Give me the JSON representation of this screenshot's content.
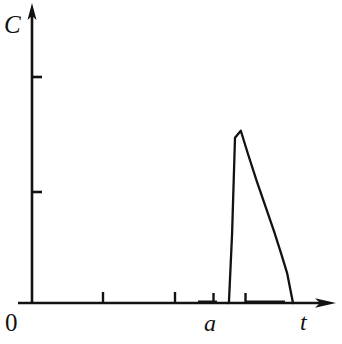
{
  "figure": {
    "title": "",
    "background_color": "#ffffff",
    "ink_color": "#121212",
    "width": 342,
    "height": 344
  },
  "labels": {
    "y_axis": "C",
    "x_axis": "t",
    "origin": "0",
    "peak_position": "a"
  },
  "chart_data": {
    "type": "line",
    "title": "",
    "xlabel": "t",
    "ylabel": "C",
    "origin_label": "0",
    "grid": false,
    "legend": null,
    "annotations": [
      {
        "text": "a",
        "x": 0.62,
        "y": 0,
        "role": "x-axis-tick-label",
        "description": "marks the time at which the concentration pulse occurs"
      }
    ],
    "axes": {
      "x": {
        "range": [
          0,
          1
        ],
        "tick_positions": [
          0.238,
          0.488,
          0.62,
          0.715
        ],
        "tick_labels": [
          "",
          "",
          "a",
          ""
        ],
        "arrow": true
      },
      "y": {
        "range": [
          0,
          1
        ],
        "tick_positions": [
          0.62,
          0.755
        ],
        "tick_labels": [
          "",
          ""
        ],
        "arrow": true
      }
    },
    "series": [
      {
        "name": "C(t)",
        "description": "sharp narrow concentration pulse: flat zero baseline, near-vertical rise at t=a, apex, then rapid slightly-concave decay back to zero",
        "x": [
          0.0,
          0.6,
          0.679,
          0.69,
          0.7,
          0.72,
          0.745,
          0.775,
          0.805,
          0.835,
          0.86,
          0.88,
          0.9,
          1.0
        ],
        "y": [
          0.0,
          0.0,
          0.0,
          0.4,
          0.95,
          0.99,
          0.855,
          0.7,
          0.555,
          0.41,
          0.28,
          0.17,
          0.0,
          0.0
        ]
      }
    ],
    "xlim": [
      0,
      1
    ],
    "ylim": [
      0,
      1
    ]
  }
}
